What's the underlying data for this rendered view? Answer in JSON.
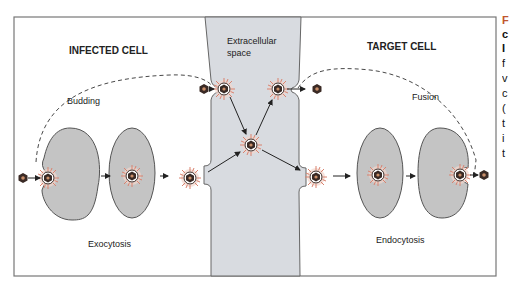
{
  "diagram": {
    "regions": {
      "left": {
        "label": "INFECTED CELL"
      },
      "center": {
        "label_line1": "Extracellular",
        "label_line2": "space"
      },
      "right": {
        "label": "TARGET CELL"
      }
    },
    "processes": {
      "budding": "Budding",
      "fusion": "Fusion",
      "exocytosis": "Exocytosis",
      "endocytosis": "Endocytosis"
    },
    "colors": {
      "cell_fill": "#c4c4c4",
      "extracellular_fill": "#d8dbe0",
      "frame": "#777777",
      "envelope_spikes": "#d9826f",
      "capsid": "#3a2a25",
      "arrow": "#222222"
    },
    "edge_text": [
      "F",
      "c",
      "I",
      "f",
      "v",
      "c",
      "(",
      "t",
      "i",
      "t"
    ]
  }
}
